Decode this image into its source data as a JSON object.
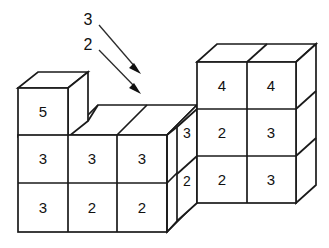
{
  "figure": {
    "background_color": "#ffffff",
    "edge_color": "#1a1a1a",
    "label_color": "#111111",
    "arrow_color": "#2b2b2b"
  },
  "annotations": [
    {
      "name": "annotation-3",
      "label": "3",
      "label_x": 88,
      "label_y": 20,
      "line_x1": 99,
      "line_y1": 25,
      "line_x2": 137,
      "line_y2": 69,
      "head_x": 140,
      "head_y": 73
    },
    {
      "name": "annotation-2",
      "label": "2",
      "label_x": 88,
      "label_y": 45,
      "line_x1": 99,
      "line_y1": 50,
      "line_x2": 137,
      "line_y2": 89,
      "head_x": 140,
      "head_y": 93
    }
  ],
  "left_block": {
    "name": "left-block",
    "columns": 3,
    "rows": 2,
    "front_faces": [
      {
        "name": "cell-left-r1c1",
        "value": "3",
        "cx": 43,
        "cy": 159
      },
      {
        "name": "cell-left-r1c2",
        "value": "3",
        "cx": 92,
        "cy": 159
      },
      {
        "name": "cell-left-r1c3",
        "value": "3",
        "cx": 142,
        "cy": 159
      },
      {
        "name": "cell-left-r2c1",
        "value": "3",
        "cx": 43,
        "cy": 208
      },
      {
        "name": "cell-left-r2c2",
        "value": "2",
        "cx": 92,
        "cy": 208
      },
      {
        "name": "cell-left-r2c3",
        "value": "2",
        "cx": 142,
        "cy": 208
      }
    ],
    "top_cube": {
      "name": "cell-left-top",
      "value": "5",
      "cx": 43,
      "cy": 112
    }
  },
  "right_block": {
    "name": "right-block",
    "columns": 2,
    "rows": 3,
    "front_faces": [
      {
        "name": "cell-right-r1c1",
        "value": "4",
        "cx": 222,
        "cy": 86
      },
      {
        "name": "cell-right-r1c2",
        "value": "4",
        "cx": 271,
        "cy": 86
      },
      {
        "name": "cell-right-r2c1",
        "value": "2",
        "cx": 222,
        "cy": 133
      },
      {
        "name": "cell-right-r2c2",
        "value": "3",
        "cx": 271,
        "cy": 133
      },
      {
        "name": "cell-right-r3c1",
        "value": "2",
        "cx": 222,
        "cy": 180
      },
      {
        "name": "cell-right-r3c2",
        "value": "3",
        "cx": 271,
        "cy": 180
      }
    ],
    "side_faces": [
      {
        "name": "side-cell-upper",
        "value": "3",
        "cx": 187,
        "cy": 133
      },
      {
        "name": "side-cell-lower",
        "value": "2",
        "cx": 187,
        "cy": 181
      }
    ]
  }
}
